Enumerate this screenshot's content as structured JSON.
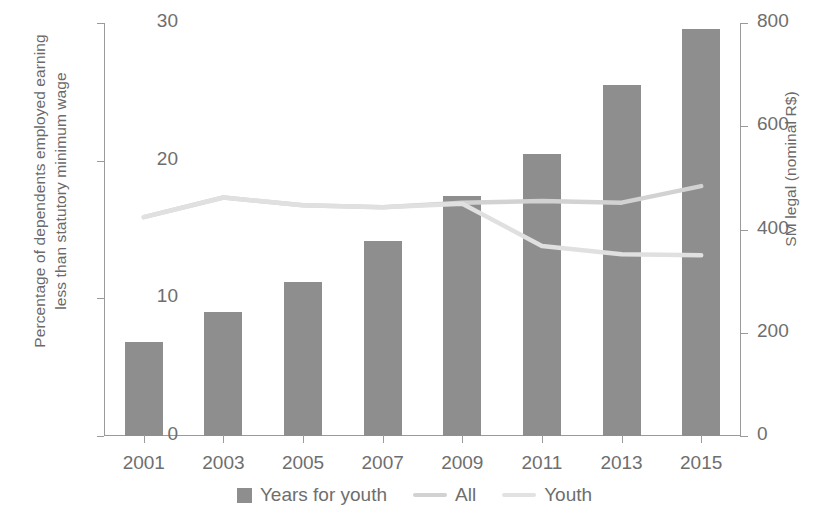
{
  "chart_data": {
    "type": "bar",
    "title": "",
    "subtitle": "",
    "xlabel": "",
    "ylabel": "Percentage of dependents employed earning less than statutory minimum wage",
    "ylabel_line1": "Percentage of dependents employed earning",
    "ylabel_line2": "less than statutory minimum wage",
    "y2label": "SM legal (nominal R$)",
    "categories": [
      "2001",
      "2003",
      "2005",
      "2007",
      "2009",
      "2011",
      "2013",
      "2015"
    ],
    "ylim": [
      0,
      30
    ],
    "yticks": [
      "0",
      "10",
      "20",
      "30"
    ],
    "ytick_values": [
      0,
      10,
      20,
      30
    ],
    "y2lim": [
      0,
      800
    ],
    "y2ticks": [
      "0",
      "200",
      "400",
      "600",
      "800"
    ],
    "y2tick_values": [
      0,
      200,
      400,
      600,
      800
    ],
    "grid": false,
    "legend_position": "bottom",
    "series": [
      {
        "name": "Years for youth",
        "type": "bar",
        "axis": "left",
        "color": "#8e8e8e",
        "values": [
          6.8,
          9.0,
          11.2,
          14.2,
          17.4,
          20.5,
          25.5,
          29.6
        ]
      },
      {
        "name": "All",
        "type": "line",
        "axis": "right",
        "color": "#d2d2d2",
        "values": [
          424,
          462,
          447,
          443,
          452,
          455,
          452,
          484
        ]
      },
      {
        "name": "Youth",
        "type": "line",
        "axis": "right",
        "color": "#e0e0e0",
        "values": [
          424,
          462,
          447,
          443,
          450,
          368,
          352,
          350
        ]
      }
    ]
  },
  "legend": {
    "items": [
      {
        "label": "Years for youth",
        "marker": "bar-swatch",
        "color": "#8e8e8e"
      },
      {
        "label": "All",
        "marker": "line-swatch",
        "color": "#d2d2d2"
      },
      {
        "label": "Youth",
        "marker": "line-swatch",
        "color": "#e2e2e2"
      }
    ]
  },
  "colors": {
    "bar": "#8e8e8e",
    "line_all": "#d2d2d2",
    "line_youth": "#e2e2e2",
    "axis": "#9a9a9a",
    "text": "#6e6e6e",
    "background": "#ffffff"
  }
}
